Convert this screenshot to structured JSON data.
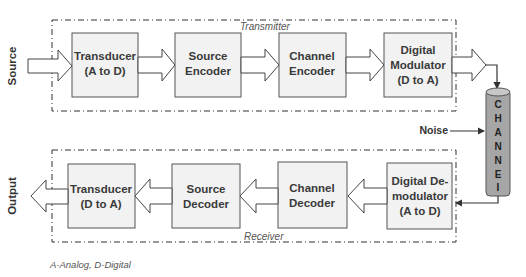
{
  "diagram": {
    "type": "communication-system-block-diagram",
    "source_label": "Source",
    "output_label": "Output",
    "noise_label": "Noise",
    "footnote": "A-Analog, D-Digital",
    "transmitter": {
      "label": "Transmitter",
      "blocks": [
        {
          "line1": "Transducer",
          "line2": "(A to D)",
          "line3": ""
        },
        {
          "line1": "Source",
          "line2": "Encoder",
          "line3": ""
        },
        {
          "line1": "Channel",
          "line2": "Encoder",
          "line3": ""
        },
        {
          "line1": "Digital",
          "line2": "Modulator",
          "line3": "(D to A)"
        }
      ]
    },
    "receiver": {
      "label": "Receiver",
      "blocks": [
        {
          "line1": "Transducer",
          "line2": "(D to A)",
          "line3": ""
        },
        {
          "line1": "Source",
          "line2": "Decoder",
          "line3": ""
        },
        {
          "line1": "Channel",
          "line2": "Decoder",
          "line3": ""
        },
        {
          "line1": "Digital De-",
          "line2": "modulator",
          "line3": "(A to D)"
        }
      ]
    },
    "channel": {
      "letters": [
        "C",
        "H",
        "A",
        "N",
        "N",
        "E",
        "I"
      ]
    },
    "colors": {
      "block_fill": "#f2f2f2",
      "block_stroke": "#555555",
      "channel_fill": "#a6a6a6",
      "line": "#333333"
    }
  }
}
